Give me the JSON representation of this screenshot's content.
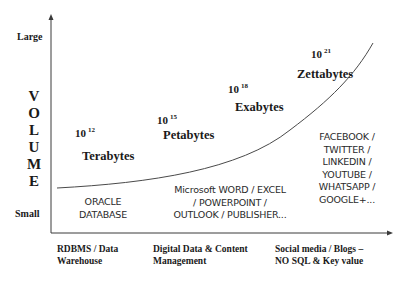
{
  "y_axis": {
    "top_label": "Large",
    "bottom_label": "Small",
    "title_letters": [
      "V",
      "O",
      "L",
      "U",
      "M",
      "E"
    ]
  },
  "stages": [
    {
      "power_base": "10",
      "power_exp": "12",
      "unit": "Terabytes",
      "examples": [
        "ORACLE",
        "DATABASE"
      ],
      "category": [
        "RDBMS / Data",
        "Warehouse"
      ]
    },
    {
      "power_base": "10",
      "power_exp": "15",
      "unit": "Petabytes",
      "examples": [
        "Microsoft WORD / EXCEL",
        "/ POWERPOINT /",
        "OUTLOOK / PUBLISHER..."
      ],
      "category": [
        "Digital Data & Content",
        "Management"
      ]
    },
    {
      "power_base": "10",
      "power_exp": "18",
      "unit": "Exabytes"
    },
    {
      "power_base": "10",
      "power_exp": "21",
      "unit": "Zettabytes",
      "examples": [
        "FACEBOOK /",
        "TWITTER /",
        "LINKEDIN /",
        "YOUTUBE /",
        "WHATSAPP /",
        "GOOGLE+..."
      ],
      "category": [
        "Social media / Blogs –",
        "NO SQL & Key value"
      ]
    }
  ],
  "colors": {
    "axis": "#3a3a3a",
    "curve": "#4a4a4a",
    "text": "#1a1a1a"
  }
}
